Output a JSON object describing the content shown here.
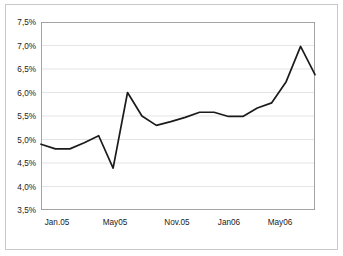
{
  "chart_data": {
    "type": "line",
    "title": "",
    "subtitle": "",
    "xlabel": "",
    "ylabel": "",
    "ylim": [
      3.5,
      7.5
    ],
    "ytick_step": 0.5,
    "ytick_labels": [
      "7,5%",
      "7,0%",
      "6,5%",
      "6,0%",
      "5,5%",
      "5,0%",
      "4,5%",
      "4,0%",
      "3,5%"
    ],
    "ytick_values": [
      7.5,
      7.0,
      6.5,
      6.0,
      5.5,
      5.0,
      4.5,
      4.0,
      3.5
    ],
    "xtick_labels": [
      "Jan.05",
      "May05",
      "Nov.05",
      "Jan06",
      "May06"
    ],
    "xtick_indices": [
      0,
      4,
      9,
      12,
      16
    ],
    "grid": "horizontal",
    "legend": "none",
    "value_unit": "%",
    "decimal_separator": ",",
    "series": [
      {
        "name": "",
        "color": "#1b1b1b",
        "marker": "none",
        "categories": [
          "Jan.05",
          "Feb05",
          "Mar05",
          "Apr05",
          "May05",
          "Jun05",
          "Jul05",
          "Aug05",
          "Sep05",
          "Nov.05",
          "Dec05",
          "Jan06x",
          "Jan06",
          "Feb06",
          "Mar06",
          "Apr06",
          "May06",
          "Jun06",
          "Jul06"
        ],
        "values": [
          4.9,
          4.8,
          4.8,
          4.93,
          5.08,
          4.39,
          6.0,
          5.5,
          5.3,
          5.38,
          5.47,
          5.58,
          5.58,
          5.49,
          5.49,
          5.67,
          5.78,
          6.23,
          6.98,
          6.38
        ]
      }
    ]
  },
  "axes": {
    "y_labels": [
      "7,5%",
      "7,0%",
      "6,5%",
      "6,0%",
      "5,5%",
      "5,0%",
      "4,5%",
      "4,0%",
      "3,5%"
    ],
    "x_labels": [
      "Jan.05",
      "May05",
      "Nov.05",
      "Jan06",
      "May06"
    ]
  }
}
